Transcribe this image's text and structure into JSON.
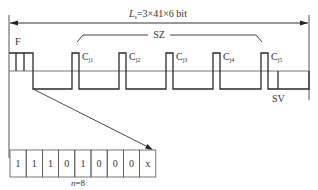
{
  "diagram": {
    "length_label": {
      "main": "L",
      "sub": "s",
      "rest": "=3×41×6 bit"
    },
    "group_label": "SZ",
    "frame_label": "F",
    "sv_label": "SV",
    "pulses": [
      {
        "main": "C",
        "sub": "j1"
      },
      {
        "main": "C",
        "sub": "j2"
      },
      {
        "main": "C",
        "sub": "j3"
      },
      {
        "main": "C",
        "sub": "j4"
      },
      {
        "main": "C",
        "sub": "j5"
      }
    ],
    "bits": [
      "1",
      "1",
      "1",
      "0",
      "1",
      "0",
      "0",
      "0",
      "x"
    ],
    "n_label": {
      "var": "n",
      "rest": "=8"
    },
    "colors": {
      "line": "#2b2b2b",
      "thin": "#555555",
      "text": "#333333"
    }
  }
}
